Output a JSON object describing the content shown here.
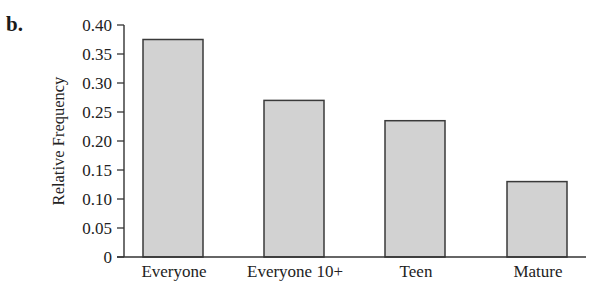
{
  "panel_label": "b.",
  "colors": {
    "bar_fill": "#d2d2d2",
    "bar_stroke": "#3a3a3a",
    "axis": "#333333",
    "text": "#222222"
  },
  "chart_data": {
    "type": "bar",
    "title": "",
    "xlabel": "",
    "ylabel": "Relative Frequency",
    "categories": [
      "Everyone",
      "Everyone 10+",
      "Teen",
      "Mature"
    ],
    "values": [
      0.375,
      0.27,
      0.235,
      0.13
    ],
    "ylim": [
      0,
      0.4
    ],
    "yticks": [
      0,
      0.05,
      0.1,
      0.15,
      0.2,
      0.25,
      0.3,
      0.35,
      0.4
    ],
    "ytick_labels": [
      "0",
      "0.05",
      "0.10",
      "0.15",
      "0.20",
      "0.25",
      "0.30",
      "0.35",
      "0.40"
    ],
    "grid": false,
    "legend": null
  }
}
